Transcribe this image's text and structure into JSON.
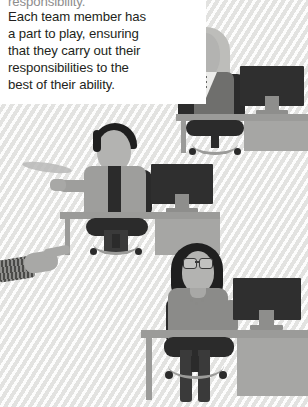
{
  "caption": {
    "lines": [
      "responsibility.",
      "Each team member has",
      "a part to play, ensuring",
      "that they carry out their",
      "responsibilities to the",
      "best of their ability."
    ]
  },
  "scene": {
    "description": "Flat illustration of three office workers at desks with monitors",
    "background_color": "#f0f0ef",
    "caption_background": "#ffffff",
    "text_color": "#231f20",
    "workers": [
      {
        "id": "worker-top",
        "hair": "light-blonde-bob",
        "outfit": "gray-suit-jacket-white-v-shirt",
        "gesture": "pointing-left",
        "accessories": []
      },
      {
        "id": "worker-middle",
        "hair": "dark-short",
        "outfit": "light-shirt-dark-tie",
        "gesture": "arm-extended-left",
        "accessories": []
      },
      {
        "id": "worker-bottom",
        "hair": "dark-with-braid",
        "outfit": "gray-sweater",
        "gesture": "seated-at-desk",
        "accessories": [
          "glasses",
          "necklace",
          "beaded-braid"
        ]
      }
    ],
    "extra_hand": {
      "id": "pointing-hand-left-edge",
      "description": "hand with striped sleeve pointing in from left edge"
    },
    "objects": {
      "desks": 3,
      "monitors": 3,
      "chairs": 3
    },
    "colors": {
      "desk": "#9b9b99",
      "monitor_screen": "#2f2f2f",
      "chair": "#2b2b2b",
      "skin": "#b3b3b1",
      "suit": "#6f6f6d",
      "hair_dark": "#1f1f1f",
      "hair_light": "#bdbdba"
    }
  }
}
